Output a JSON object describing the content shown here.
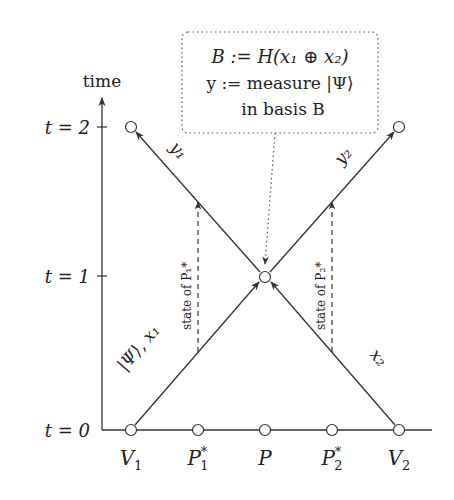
{
  "diagram": {
    "axis": {
      "label": "time",
      "ticks": [
        {
          "label": "t = 0",
          "t": 0
        },
        {
          "label": "t = 1",
          "t": 1
        },
        {
          "label": "t = 2",
          "t": 2
        }
      ]
    },
    "nodes": [
      {
        "id": "V1",
        "label": "V",
        "sub": "1",
        "sup": ""
      },
      {
        "id": "P1star",
        "label": "P",
        "sub": "1",
        "sup": "*"
      },
      {
        "id": "P",
        "label": "P",
        "sub": "",
        "sup": ""
      },
      {
        "id": "P2star",
        "label": "P",
        "sub": "2",
        "sup": "*"
      },
      {
        "id": "V2",
        "label": "V",
        "sub": "2",
        "sup": ""
      }
    ],
    "edges": {
      "left_in": "|Ψ⟩, x₁",
      "right_in": "x₂",
      "left_out": "y₁",
      "right_out": "y₂",
      "dashed_left": "state of P₁*",
      "dashed_right": "state of P₂*"
    },
    "box": {
      "line1": "B := H(x₁ ⊕ x₂)",
      "line2": "y := measure |Ψ⟩",
      "line3": "in basis B"
    }
  }
}
